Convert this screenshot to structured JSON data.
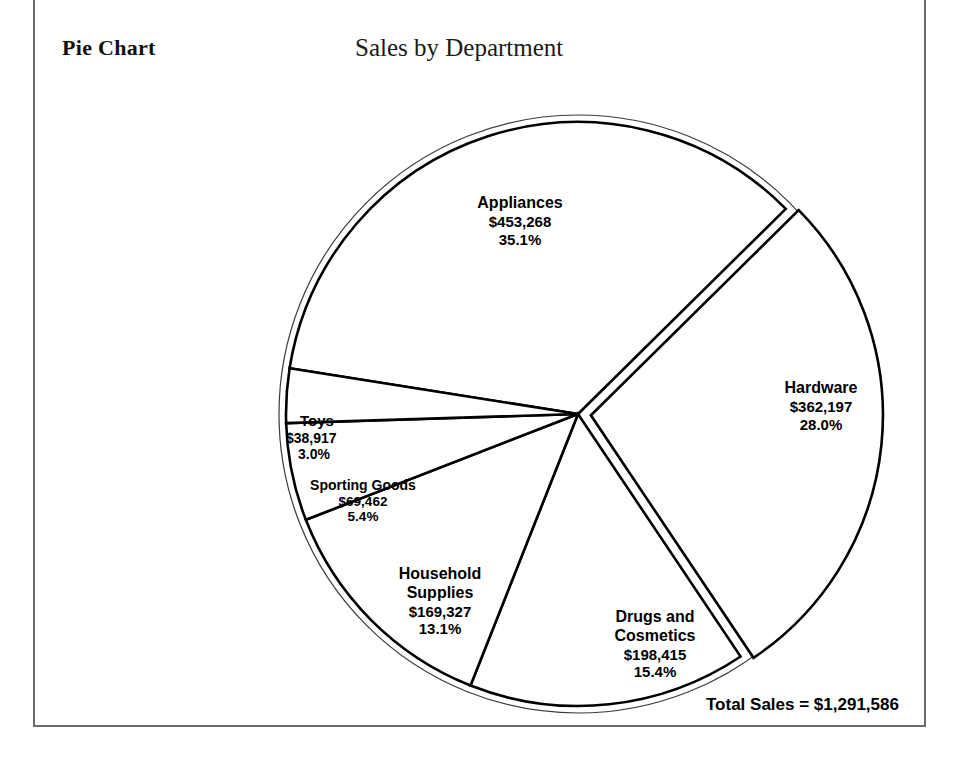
{
  "header": {
    "section_label": "Pie Chart",
    "title": "Sales by Department"
  },
  "footer": {
    "total_sales": "Total Sales = $1,291,586"
  },
  "chart_data": {
    "type": "pie",
    "title": "Sales by Department",
    "total_label": "Total Sales = $1,291,586",
    "total_value": 1291586,
    "currency": "$",
    "exploded_slice": "Hardware",
    "grid": false,
    "legend": "none",
    "labels_inside": true,
    "categories": [
      "Appliances",
      "Hardware",
      "Drugs and Cosmetics",
      "Household Supplies",
      "Sporting Goods",
      "Toys"
    ],
    "values": [
      453268,
      362197,
      198415,
      169327,
      69462,
      38917
    ],
    "percentages": [
      35.1,
      28.0,
      15.4,
      13.1,
      5.4,
      3.0
    ],
    "slices": [
      {
        "name": "Appliances",
        "name_line1": "Appliances",
        "name_line2": "",
        "value": 453268,
        "value_text": "$453,268",
        "percent": 35.1,
        "percent_text": "35.1%",
        "exploded": false
      },
      {
        "name": "Hardware",
        "name_line1": "Hardware",
        "name_line2": "",
        "value": 362197,
        "value_text": "$362,197",
        "percent": 28.0,
        "percent_text": "28.0%",
        "exploded": true
      },
      {
        "name": "Drugs and Cosmetics",
        "name_line1": "Drugs and",
        "name_line2": "Cosmetics",
        "value": 198415,
        "value_text": "$198,415",
        "percent": 15.4,
        "percent_text": "15.4%",
        "exploded": false
      },
      {
        "name": "Household Supplies",
        "name_line1": "Household",
        "name_line2": "Supplies",
        "value": 169327,
        "value_text": "$169,327",
        "percent": 13.1,
        "percent_text": "13.1%",
        "exploded": false
      },
      {
        "name": "Sporting Goods",
        "name_line1": "Sporting Goods",
        "name_line2": "",
        "value": 69462,
        "value_text": "$69,462",
        "percent": 5.4,
        "percent_text": "5.4%",
        "exploded": false
      },
      {
        "name": "Toys",
        "name_line1": "Toys",
        "name_line2": "",
        "value": 38917,
        "value_text": "$38,917",
        "percent": 3.0,
        "percent_text": "3.0%",
        "exploded": false
      }
    ],
    "colors": {
      "slice_fill": "#ffffff",
      "slice_stroke": "#000000",
      "ghost_stroke": "#3a3a3a",
      "text": "#000000",
      "frame": "#6b6b6b",
      "background": "#ffffff"
    }
  }
}
